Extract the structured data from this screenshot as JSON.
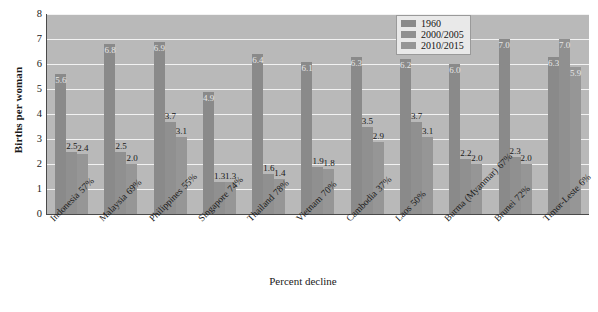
{
  "chart_data": {
    "type": "bar",
    "title": "",
    "xlabel": "Percent decline",
    "ylabel": "Births per woman",
    "ylim": [
      0,
      8
    ],
    "yticks": [
      0,
      1,
      2,
      3,
      4,
      5,
      6,
      7,
      8
    ],
    "grid": true,
    "legend_position": "top-right",
    "categories": [
      "Indonesia",
      "Malaysia",
      "Philippines",
      "Singapore",
      "Thailand",
      "Vietnam",
      "Cambodia",
      "Laos",
      "Burma (Myanmar)",
      "Brunei",
      "Timor-Leste"
    ],
    "category_sublabels": [
      "57%",
      "69%",
      "55%",
      "74%",
      "78%",
      "70%",
      "37%",
      "50%",
      "67%",
      "72%",
      "6%"
    ],
    "series": [
      {
        "name": "1960",
        "color": "#8a8a8a",
        "values": [
          5.6,
          6.8,
          6.9,
          4.9,
          6.4,
          6.1,
          6.3,
          6.2,
          6.0,
          7.0,
          6.3
        ]
      },
      {
        "name": "2000/2005",
        "color": "#909090",
        "values": [
          2.5,
          2.5,
          3.7,
          1.3,
          1.6,
          1.9,
          3.5,
          3.7,
          2.2,
          2.3,
          7.0
        ]
      },
      {
        "name": "2010/2015",
        "color": "#969696",
        "values": [
          2.4,
          2.0,
          3.1,
          1.3,
          1.4,
          1.8,
          2.9,
          3.1,
          2.0,
          2.0,
          5.9
        ]
      }
    ],
    "value_labels": [
      [
        "5.6",
        "2.5",
        "2.4"
      ],
      [
        "6.8",
        "2.5",
        "2.0"
      ],
      [
        "6.9",
        "3.7",
        "3.1"
      ],
      [
        "4.9",
        "1.3",
        "1.3"
      ],
      [
        "6.4",
        "1.6",
        "1.4"
      ],
      [
        "6.1",
        "1.9",
        "1.8"
      ],
      [
        "6.3",
        "3.5",
        "2.9"
      ],
      [
        "6.2",
        "3.7",
        "3.1"
      ],
      [
        "6.0",
        "2.2",
        "2.0"
      ],
      [
        "7.0",
        "2.3",
        "2.0"
      ],
      [
        "6.3",
        "7.0",
        "5.9"
      ]
    ],
    "plot_background": "#b9b9b9",
    "gridline_color": "#f2f2f2"
  },
  "legend": {
    "entries": [
      {
        "label": "1960"
      },
      {
        "label": "2000/2005"
      },
      {
        "label": "2010/2015"
      }
    ]
  }
}
